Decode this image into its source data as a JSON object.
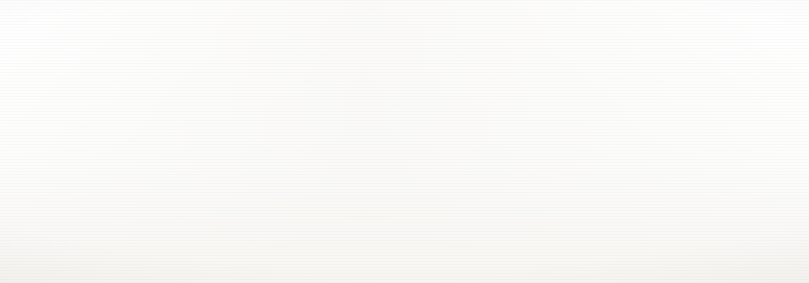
{
  "figure": {
    "kind": "evolutionary-tree-timeline",
    "title_visible": false
  },
  "captions": [
    {
      "id": "devonian",
      "text": "DEVONIAN, 416–359 MILLION YEARS AGO",
      "x": 120,
      "y": 268
    },
    {
      "id": "carboniferous",
      "text": "CARBONIFEROUS, 359–299 MILLION YEARS AGO",
      "x": 528,
      "y": 268
    }
  ],
  "period_divider": {
    "x": 628,
    "visible": true
  },
  "vertebrate_lineages": [
    {
      "id": "jawless-fish",
      "label": "Jawless fish",
      "label_x": 528,
      "label_y": 8,
      "band_y": 10,
      "band_h": 7,
      "color": "#c9cbcd",
      "extinct": false,
      "note": "thin pale band running full width, curves up at far right"
    },
    {
      "id": "cartilagenous-fish",
      "label": "Cartilagenous fish",
      "label_x": 352,
      "label_y": 35,
      "band_y": 36,
      "band_h": 7,
      "color": "#b9bcbe",
      "extinct": false,
      "note": "mid-grey band, rises at far right edge"
    },
    {
      "id": "sharks",
      "label": "Sharks",
      "label_x": 528,
      "label_y": 35,
      "band_y": 36,
      "band_h": 7,
      "color": "#b9bcbe",
      "extinct": false,
      "note": "shares the cartilagenous fish band"
    },
    {
      "id": "armoured-fish",
      "label": "Armoured fish",
      "label_x": 352,
      "label_y": 62,
      "band_y": 63,
      "band_h": 8,
      "color": "#9a9da0",
      "extinct": true,
      "extinction_dot": {
        "x": 511,
        "y": 67,
        "r": 10,
        "color": "#8f9295"
      },
      "note": "enters from a curve at the far left, terminates in a round blob"
    },
    {
      "id": "bony-fish",
      "label": "Bony fish",
      "label_x": 528,
      "label_y": 99,
      "band_y": 100,
      "band_h": 8,
      "color": "#8c8f92",
      "extinct": false,
      "note": "dark band across the full width; branches upward near x=690"
    }
  ],
  "invertebrate_lineages": [
    {
      "id": "chordates",
      "label": "Chordates",
      "y": 100,
      "h": 9,
      "color": "#8c8f92"
    },
    {
      "id": "brachiopods",
      "label": "Brachiopods",
      "y": 113,
      "h": 9,
      "color": "#b4b7b9"
    },
    {
      "id": "echinoderms",
      "label": "Echinoderms",
      "y": 127,
      "h": 9,
      "color": "#dedfe0"
    },
    {
      "id": "hemichordates",
      "label": "Hemichordates",
      "y": 140,
      "h": 9,
      "color": "#e9eaea"
    },
    {
      "id": "sponges",
      "label": "Sponges",
      "y": 154,
      "h": 9,
      "color": "#b0b3b5"
    },
    {
      "id": "jellyfish",
      "label": "Jellyfish",
      "y": 167,
      "h": 9,
      "color": "#cdcfd0"
    },
    {
      "id": "corals",
      "label": "Corals",
      "y": 181,
      "h": 9,
      "color": "#e6e7e7"
    },
    {
      "id": "flatworms",
      "label": "Flatworms",
      "y": 194,
      "h": 10,
      "color": "#6e7174"
    },
    {
      "id": "molluscs",
      "label": "Molluscs",
      "y": 208,
      "h": 9,
      "color": "#c2c4c6"
    },
    {
      "id": "annelids",
      "label": "Annelids",
      "y": 222,
      "h": 9,
      "color": "#d9dadb"
    },
    {
      "id": "arthropods",
      "label": "Arthropods",
      "y": 235,
      "h": 9,
      "color": "#c8cacb"
    }
  ],
  "invertebrate_label_x": 113,
  "organism_illustrations": [
    {
      "id": "brachiopod-shell",
      "x": 72,
      "y": 104,
      "w": 34,
      "h": 26
    },
    {
      "id": "hemichordate-worm",
      "x": 58,
      "y": 140,
      "w": 40,
      "h": 20
    },
    {
      "id": "jellyfish",
      "x": 62,
      "y": 162,
      "w": 30,
      "h": 32
    },
    {
      "id": "starfish",
      "x": 196,
      "y": 124,
      "w": 34,
      "h": 34
    },
    {
      "id": "coral",
      "x": 222,
      "y": 147,
      "w": 30,
      "h": 26
    },
    {
      "id": "sea-fan",
      "x": 172,
      "y": 180,
      "w": 32,
      "h": 30
    },
    {
      "id": "trilobite",
      "x": 192,
      "y": 212,
      "w": 40,
      "h": 26
    },
    {
      "id": "ammonite",
      "x": 148,
      "y": 232,
      "w": 34,
      "h": 26
    },
    {
      "id": "sea-lily",
      "x": 150,
      "y": 96,
      "w": 42,
      "h": 22
    }
  ],
  "fish_illustrations": [
    {
      "id": "jawless-fish-art",
      "x": 462,
      "y": 2,
      "w": 66,
      "h": 22
    },
    {
      "id": "shark-art",
      "x": 570,
      "y": 26,
      "w": 74,
      "h": 26
    },
    {
      "id": "armoured-fish-art",
      "x": 438,
      "y": 46,
      "w": 86,
      "h": 32
    },
    {
      "id": "bony-fish-art",
      "x": 592,
      "y": 86,
      "w": 72,
      "h": 26
    }
  ],
  "colors": {
    "ink": "#17181a",
    "caption_ink": "#2b2c2e",
    "paper": "#fbfbfa",
    "band_dark": "#6e7174",
    "band_mid": "#b4b7b9",
    "band_light": "#e6e7e7"
  }
}
